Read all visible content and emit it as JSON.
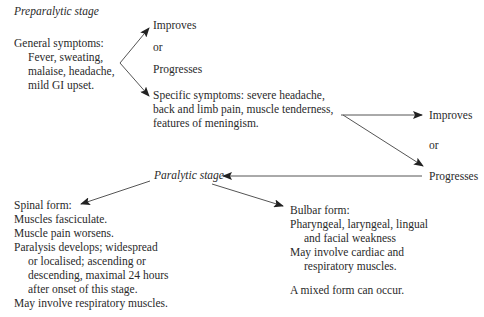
{
  "preparalytic": {
    "title": "Preparalytic stage",
    "general": {
      "heading": "General symptoms:",
      "lines": [
        "Fever, sweating,",
        "malaise, headache,",
        "mild GI upset."
      ]
    },
    "outcome1": {
      "improves": "Improves",
      "or": "or",
      "progresses": "Progresses"
    },
    "specific": {
      "lines": [
        "Specific symptoms: severe headache,",
        "back and limb pain, muscle tenderness,",
        "features of meningism."
      ]
    },
    "outcome2": {
      "improves": "Improves",
      "or": "or",
      "progresses": "Progresses"
    }
  },
  "paralytic": {
    "title": "Paralytic stage",
    "spinal": {
      "heading": "Spinal form:",
      "lines": [
        "Muscles fasciculate.",
        "Muscle pain worsens.",
        "Paralysis develops; widespread",
        "or localised; ascending or",
        "descending, maximal 24 hours",
        "after onset of this stage.",
        "May involve respiratory muscles."
      ]
    },
    "bulbar": {
      "heading": "Bulbar form:",
      "lines": [
        "Pharyngeal, laryngeal, lingual",
        "and facial weakness",
        "May involve cardiac and",
        "respiratory muscles."
      ],
      "note": "A mixed form can occur."
    }
  },
  "colors": {
    "text": "#2a2a2a",
    "arrow": "#444444",
    "background": "#ffffff"
  }
}
